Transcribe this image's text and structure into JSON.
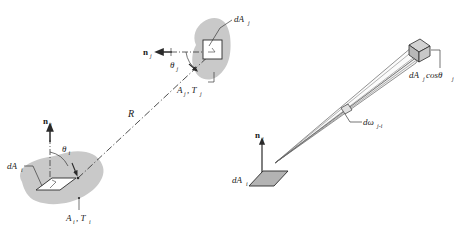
{
  "figure": {
    "top_artifact_text": "",
    "colors": {
      "blob_fill": "#c9c9c9",
      "patch_fill": "#b3b3b3",
      "patch_fill_light": "#d0d0d0",
      "line": "#3a3a3a",
      "text": "#1a1a1a",
      "background": "#ffffff"
    }
  },
  "left_diagram": {
    "name": "two-surface-view-factor",
    "labels": {
      "normal_i": "n",
      "normal_i_sub": "i",
      "normal_j": "n",
      "normal_j_sub": "j",
      "theta_i": "θ",
      "theta_i_sub": "i",
      "theta_j": "θ",
      "theta_j_sub": "j",
      "distance": "R",
      "dA_i": "dA",
      "dA_i_sub": "i",
      "dA_j": "dA",
      "dA_j_sub": "j",
      "surface_i": "A",
      "surface_i_sub": "i",
      "surface_i_temp": ", T",
      "surface_i_temp_sub": "i",
      "surface_j": "A",
      "surface_j_sub": "j",
      "surface_j_temp": ", T",
      "surface_j_temp_sub": "j"
    }
  },
  "right_diagram": {
    "name": "solid-angle-projection",
    "labels": {
      "normal_i": "n",
      "normal_i_sub": "i",
      "dA_i": "dA",
      "dA_i_sub": "i",
      "solid_angle": "dω",
      "solid_angle_sub": "j-i",
      "projected_area": "dA",
      "projected_area_sub": "j",
      "projected_area_cos": " cosθ",
      "projected_area_cos_sub": "j"
    }
  }
}
